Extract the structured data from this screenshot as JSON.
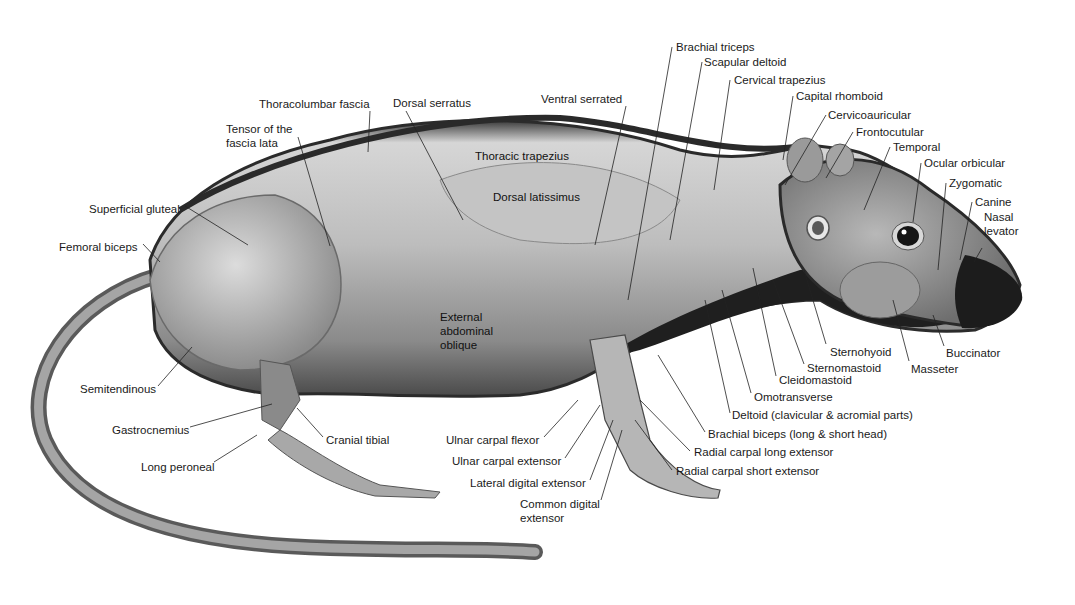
{
  "diagram": {
    "colors": {
      "background": "#ffffff",
      "fur_dark": "#2a2a2a",
      "muscle_light": "#d8d8d8",
      "muscle_mid": "#a6a6a6",
      "text": "#1a1a1a",
      "leader": "#222222"
    },
    "labels": [
      {
        "id": "brachial-triceps",
        "text": "Brachial triceps",
        "x": 676,
        "y": 40,
        "lx1": 672,
        "ly1": 47,
        "lx2": 628,
        "ly2": 300
      },
      {
        "id": "scapular-deltoid",
        "text": "Scapular deltoid",
        "x": 704,
        "y": 55,
        "lx1": 702,
        "ly1": 62,
        "lx2": 670,
        "ly2": 240
      },
      {
        "id": "cervical-trapezius",
        "text": "Cervical trapezius",
        "x": 734,
        "y": 73,
        "lx1": 730,
        "ly1": 80,
        "lx2": 714,
        "ly2": 190
      },
      {
        "id": "capital-rhomboid",
        "text": "Capital rhomboid",
        "x": 796,
        "y": 89,
        "lx1": 793,
        "ly1": 96,
        "lx2": 783,
        "ly2": 160
      },
      {
        "id": "cervicoauricular",
        "text": "Cervicoauricular",
        "x": 828,
        "y": 108,
        "lx1": 826,
        "ly1": 115,
        "lx2": 785,
        "ly2": 185
      },
      {
        "id": "frontocutular",
        "text": "Frontocutular",
        "x": 856,
        "y": 125,
        "lx1": 853,
        "ly1": 132,
        "lx2": 826,
        "ly2": 178
      },
      {
        "id": "temporal",
        "text": "Temporal",
        "x": 893,
        "y": 140,
        "lx1": 890,
        "ly1": 147,
        "lx2": 864,
        "ly2": 210
      },
      {
        "id": "ocular-orbicular",
        "text": "Ocular orbicular",
        "x": 924,
        "y": 156,
        "lx1": 921,
        "ly1": 163,
        "lx2": 913,
        "ly2": 222
      },
      {
        "id": "zygomatic",
        "text": "Zygomatic",
        "x": 949,
        "y": 176,
        "lx1": 946,
        "ly1": 183,
        "lx2": 938,
        "ly2": 270
      },
      {
        "id": "canine",
        "text": "Canine",
        "x": 975,
        "y": 195,
        "lx1": 972,
        "ly1": 202,
        "lx2": 960,
        "ly2": 260
      },
      {
        "id": "nasal-levator",
        "text": "Nasal\nlevator",
        "x": 984,
        "y": 210,
        "lx1": 982,
        "ly1": 248,
        "lx2": 974,
        "ly2": 262
      },
      {
        "id": "ventral-serrated",
        "text": "Ventral serrated",
        "x": 541,
        "y": 92,
        "lx1": 626,
        "ly1": 106,
        "lx2": 595,
        "ly2": 245
      },
      {
        "id": "thoracolumbar-fascia",
        "text": "Thoracolumbar fascia",
        "x": 259,
        "y": 97,
        "lx1": 370,
        "ly1": 111,
        "lx2": 368,
        "ly2": 152
      },
      {
        "id": "dorsal-serratus",
        "text": "Dorsal serratus",
        "x": 393,
        "y": 96,
        "lx1": 406,
        "ly1": 111,
        "lx2": 463,
        "ly2": 220
      },
      {
        "id": "tensor-fascia-lata",
        "text": "Tensor of the\nfascia lata",
        "x": 226,
        "y": 122,
        "lx1": 298,
        "ly1": 137,
        "lx2": 330,
        "ly2": 246
      },
      {
        "id": "superficial-gluteal",
        "text": "Superficial gluteal",
        "x": 89,
        "y": 202,
        "lx1": 185,
        "ly1": 206,
        "lx2": 248,
        "ly2": 245
      },
      {
        "id": "femoral-biceps",
        "text": "Femoral biceps",
        "x": 59,
        "y": 240,
        "lx1": 143,
        "ly1": 244,
        "lx2": 160,
        "ly2": 262
      },
      {
        "id": "thoracic-trapezius",
        "text": "Thoracic trapezius",
        "x": 475,
        "y": 149,
        "inner": true
      },
      {
        "id": "dorsal-latissimus",
        "text": "Dorsal latissimus",
        "x": 493,
        "y": 190,
        "inner": true
      },
      {
        "id": "external-abdominal-oblique",
        "text": "External\nabdominal\noblique",
        "x": 440,
        "y": 310,
        "inner": true
      },
      {
        "id": "semitendinous",
        "text": "Semitendinous",
        "x": 80,
        "y": 382,
        "lx1": 158,
        "ly1": 386,
        "lx2": 192,
        "ly2": 347
      },
      {
        "id": "gastrocnemius",
        "text": "Gastrocnemius",
        "x": 112,
        "y": 423,
        "lx1": 190,
        "ly1": 427,
        "lx2": 272,
        "ly2": 404
      },
      {
        "id": "cranial-tibial",
        "text": "Cranial tibial",
        "x": 326,
        "y": 433,
        "lx1": 323,
        "ly1": 437,
        "lx2": 297,
        "ly2": 408
      },
      {
        "id": "long-peroneal",
        "text": "Long peroneal",
        "x": 141,
        "y": 460,
        "lx1": 214,
        "ly1": 462,
        "lx2": 257,
        "ly2": 435
      },
      {
        "id": "ulnar-carpal-flexor",
        "text": "Ulnar carpal flexor",
        "x": 446,
        "y": 433,
        "lx1": 544,
        "ly1": 437,
        "lx2": 578,
        "ly2": 400
      },
      {
        "id": "ulnar-carpal-extensor",
        "text": "Ulnar carpal extensor",
        "x": 452,
        "y": 454,
        "lx1": 565,
        "ly1": 458,
        "lx2": 600,
        "ly2": 405
      },
      {
        "id": "lateral-digital-extensor",
        "text": "Lateral digital extensor",
        "x": 470,
        "y": 476,
        "lx1": 590,
        "ly1": 480,
        "lx2": 613,
        "ly2": 420
      },
      {
        "id": "common-digital-extensor",
        "text": "Common digital\nextensor",
        "x": 520,
        "y": 497,
        "lx1": 601,
        "ly1": 500,
        "lx2": 622,
        "ly2": 430
      },
      {
        "id": "radial-carpal-short-extensor",
        "text": "Radial carpal short extensor",
        "x": 676,
        "y": 464,
        "lx1": 672,
        "ly1": 470,
        "lx2": 635,
        "ly2": 420
      },
      {
        "id": "radial-carpal-long-extensor",
        "text": "Radial carpal long extensor",
        "x": 694,
        "y": 445,
        "lx1": 690,
        "ly1": 451,
        "lx2": 640,
        "ly2": 400
      },
      {
        "id": "brachial-biceps",
        "text": "Brachial biceps (long & short head)",
        "x": 708,
        "y": 427,
        "lx1": 705,
        "ly1": 432,
        "lx2": 658,
        "ly2": 355
      },
      {
        "id": "deltoid",
        "text": "Deltoid (clavicular & acromial parts)",
        "x": 732,
        "y": 408,
        "lx1": 730,
        "ly1": 413,
        "lx2": 705,
        "ly2": 300
      },
      {
        "id": "omotransverse",
        "text": "Omotransverse",
        "x": 754,
        "y": 390,
        "lx1": 751,
        "ly1": 393,
        "lx2": 722,
        "ly2": 290
      },
      {
        "id": "cleidomastoid",
        "text": "Cleidomastoid",
        "x": 779,
        "y": 373,
        "lx1": 776,
        "ly1": 376,
        "lx2": 753,
        "ly2": 268
      },
      {
        "id": "sternomastoid",
        "text": "Sternomastoid",
        "x": 807,
        "y": 361,
        "lx1": 804,
        "ly1": 364,
        "lx2": 773,
        "ly2": 280
      },
      {
        "id": "sternohyoid",
        "text": "Sternohyoid",
        "x": 830,
        "y": 345,
        "lx1": 826,
        "ly1": 344,
        "lx2": 804,
        "ly2": 270
      },
      {
        "id": "masseter",
        "text": "Masseter",
        "x": 911,
        "y": 362,
        "lx1": 909,
        "ly1": 361,
        "lx2": 893,
        "ly2": 300
      },
      {
        "id": "buccinator",
        "text": "Buccinator",
        "x": 946,
        "y": 346,
        "lx1": 944,
        "ly1": 346,
        "lx2": 933,
        "ly2": 315
      }
    ]
  }
}
